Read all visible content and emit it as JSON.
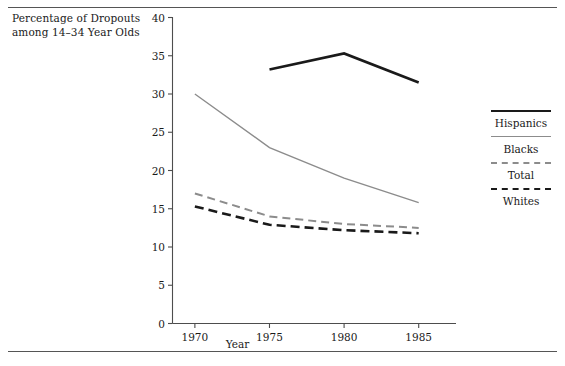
{
  "figure": {
    "title_line1": "Percentage of Dropouts",
    "title_line2": "among 14–34 Year Olds",
    "xlabel": "Year",
    "rule_color": "#555555"
  },
  "legend": {
    "position": "right",
    "entries": [
      {
        "label": "Hispanics",
        "style": "solid-thick-black",
        "color": "#1a1a1a"
      },
      {
        "label": "Blacks",
        "style": "solid-thin-gray",
        "color": "#8c8c8c"
      },
      {
        "label": "Total",
        "style": "dashed-gray",
        "color": "#8c8c8c"
      },
      {
        "label": "Whites",
        "style": "dashed-thick-black",
        "color": "#1a1a1a"
      }
    ]
  },
  "chart_data": {
    "type": "line",
    "title": "Percentage of Dropouts among 14–34 Year Olds",
    "xlabel": "Year",
    "ylabel": "",
    "x": [
      1970,
      1975,
      1980,
      1985
    ],
    "xlim": [
      1968.5,
      1987.5
    ],
    "ylim": [
      0,
      40
    ],
    "xticks": [
      1970,
      1975,
      1980,
      1985
    ],
    "xticklabels": [
      "1970",
      "1975",
      "1980",
      "1985"
    ],
    "yticks": [
      0,
      5,
      10,
      15,
      20,
      25,
      30,
      35,
      40
    ],
    "yticklabels": [
      "0",
      "5",
      "10",
      "15",
      "20",
      "25",
      "30",
      "35",
      "40"
    ],
    "grid": false,
    "legend_position": "right",
    "series": [
      {
        "name": "Hispanics",
        "x": [
          1975,
          1980,
          1985
        ],
        "values": [
          33.2,
          35.3,
          31.5
        ],
        "color": "#1a1a1a",
        "linestyle": "solid",
        "linewidth": 2.6
      },
      {
        "name": "Blacks",
        "x": [
          1970,
          1975,
          1980,
          1985
        ],
        "values": [
          30.0,
          23.0,
          19.0,
          15.8
        ],
        "color": "#8c8c8c",
        "linestyle": "solid",
        "linewidth": 1.4
      },
      {
        "name": "Total",
        "x": [
          1970,
          1975,
          1980,
          1985
        ],
        "values": [
          17.0,
          14.0,
          13.0,
          12.5
        ],
        "color": "#8c8c8c",
        "linestyle": "dashed",
        "linewidth": 2.0
      },
      {
        "name": "Whites",
        "x": [
          1970,
          1975,
          1980,
          1985
        ],
        "values": [
          15.3,
          12.9,
          12.2,
          11.8
        ],
        "color": "#1a1a1a",
        "linestyle": "dashed",
        "linewidth": 2.6
      }
    ]
  }
}
